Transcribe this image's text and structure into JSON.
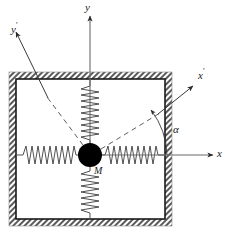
{
  "figure": {
    "type": "mechanical-schematic",
    "width": 228,
    "height": 242,
    "background_color": "#ffffff",
    "line_color": "#4a4a4a",
    "dark_line_color": "#1a1a1a",
    "hatch_color": "#555555",
    "mass_color": "#000000"
  },
  "labels": {
    "y_axis": "y",
    "y_prime_axis": "y",
    "y_prime_mark": "′",
    "x_axis": "x",
    "x_prime_axis": "x",
    "x_prime_mark": "′",
    "angle": "α",
    "mass": "M"
  },
  "geometry": {
    "origin": {
      "x": 90,
      "y": 155
    },
    "frame_outer": {
      "x": 9,
      "y": 72,
      "w": 163,
      "h": 154
    },
    "frame_inner": {
      "x": 16,
      "y": 79,
      "w": 149,
      "h": 140
    },
    "mass_radius": 12,
    "angle_degrees": 37,
    "x_axis_end": {
      "x": 216,
      "y": 155
    },
    "y_axis_end": {
      "x": 90,
      "y": 13
    },
    "x_prime_end": {
      "x": 196,
      "y": 83
    },
    "y_prime_end": {
      "x": 13,
      "y": 28
    },
    "arc_radius": 52
  },
  "springs": [
    {
      "name": "left-spring",
      "orientation": "horizontal",
      "coils": 11,
      "from": "left-wall",
      "to": "mass"
    },
    {
      "name": "right-spring",
      "orientation": "horizontal",
      "coils": 11,
      "from": "mass",
      "to": "right-wall"
    },
    {
      "name": "top-spring",
      "orientation": "vertical",
      "coils": 9,
      "from": "top-wall",
      "to": "mass"
    },
    {
      "name": "bottom-spring",
      "orientation": "vertical",
      "coils": 9,
      "from": "mass",
      "to": "bottom-wall"
    }
  ]
}
